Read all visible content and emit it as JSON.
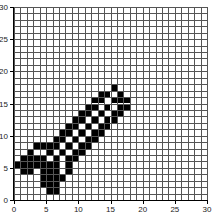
{
  "grid": {
    "cols": 30,
    "rows": 30,
    "cell_color": "#000000",
    "line_color": "#555555",
    "background": "#ffffff"
  },
  "axes": {
    "x_ticks": [
      "0",
      "5",
      "10",
      "15",
      "20",
      "25",
      "30"
    ],
    "y_ticks": [
      "0",
      "5",
      "10",
      "15",
      "20",
      "25",
      "30"
    ]
  },
  "filled_cells": {
    "17": [
      15
    ],
    "16": [
      13,
      14,
      16
    ],
    "15": [
      12,
      13,
      15,
      16,
      17
    ],
    "14": [
      11,
      12,
      14,
      16,
      17
    ],
    "13": [
      10,
      11,
      13,
      15,
      16
    ],
    "12": [
      9,
      10,
      12,
      14,
      15
    ],
    "11": [
      8,
      9,
      11,
      13,
      14
    ],
    "10": [
      7,
      8,
      10,
      12,
      13
    ],
    "9": [
      6,
      7,
      9,
      11,
      12
    ],
    "8": [
      3,
      4,
      5,
      6,
      8,
      10,
      11
    ],
    "7": [
      2,
      5,
      7,
      9,
      10
    ],
    "6": [
      1,
      2,
      3,
      4,
      6,
      8,
      9
    ],
    "5": [
      0,
      1,
      2,
      3,
      4,
      5,
      6,
      8
    ],
    "4": [
      1,
      2,
      4,
      5,
      6,
      8
    ],
    "3": [
      4,
      5,
      6,
      7
    ],
    "2": [
      4,
      5,
      6
    ],
    "1": [
      5,
      6
    ]
  }
}
